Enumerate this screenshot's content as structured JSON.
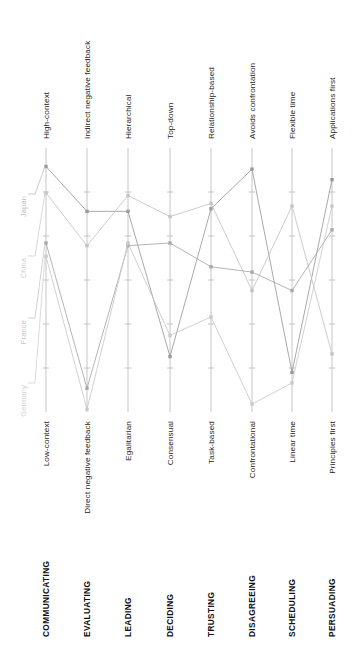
{
  "chart_data": {
    "type": "line",
    "title": "",
    "subtitle": "",
    "xlabel": "",
    "ylabel": "",
    "grid": false,
    "legend_position": "inline-left",
    "orientation": "parallel-coordinates",
    "scale_note": "Each dimension axis runs from the bottom pole (value 0) to the top pole (value 10).",
    "ylim": [
      0,
      10
    ],
    "categories": [
      "COMMUNICATING",
      "EVALUATING",
      "LEADING",
      "DECIDING",
      "TRUSTING",
      "DISAGREEING",
      "SCHEDULING",
      "PERSUADING"
    ],
    "axis_top_labels": [
      "High-context",
      "Indirect negative feedback",
      "Hierarchical",
      "Top-down",
      "Relationship-based",
      "Avoids confrontation",
      "Flexible time",
      "Applications first"
    ],
    "axis_bottom_labels": [
      "Low-context",
      "Direct negative feedback",
      "Egalitarian",
      "Consensual",
      "Task-based",
      "Confrontational",
      "Linear time",
      "Principles first"
    ],
    "series": [
      {
        "name": "Japan",
        "color": "#9a9a9a",
        "values": [
          9.3,
          7.6,
          7.6,
          2.1,
          7.7,
          9.2,
          1.5,
          8.8
        ]
      },
      {
        "name": "China",
        "color": "#c4c4c4",
        "values": [
          8.3,
          6.3,
          8.2,
          7.4,
          7.9,
          4.6,
          7.8,
          2.2
        ]
      },
      {
        "name": "France",
        "color": "#a8a8a8",
        "values": [
          6.4,
          0.9,
          6.3,
          6.4,
          5.5,
          5.3,
          4.6,
          6.9
        ]
      },
      {
        "name": "Germany",
        "color": "#c9c9c9",
        "values": [
          5.9,
          0.1,
          6.4,
          2.9,
          3.6,
          0.3,
          1.1,
          7.8
        ]
      }
    ]
  },
  "geometry": {
    "axis_x": [
      46,
      87,
      128,
      170,
      211,
      252,
      292,
      332
    ],
    "axis_top_y": 148,
    "axis_bottom_y": 412,
    "tick_count": 5,
    "label_color_dim": "#111111",
    "label_color_pole": "#1c1c1c",
    "axis_color": "#b8b8b8",
    "background": "#ffffff"
  },
  "country_legend": [
    {
      "label": "Japan",
      "color": "#bdbdbd",
      "y": 196
    },
    {
      "label": "China",
      "color": "#cfcfcf",
      "y": 258
    },
    {
      "label": "France",
      "color": "#c6c6c6",
      "y": 320
    },
    {
      "label": "Germany",
      "color": "#d2d2d2",
      "y": 385
    }
  ]
}
